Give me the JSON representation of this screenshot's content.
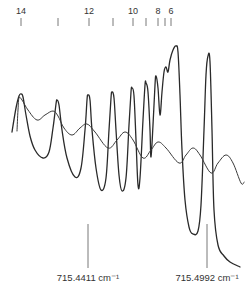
{
  "chart_data": {
    "type": "line",
    "title": "",
    "xlabel": "",
    "ylabel": "",
    "grid": false,
    "legend": null,
    "top_ticks": {
      "positions_px": [
        21,
        58,
        89,
        113,
        133,
        146,
        158,
        165,
        171
      ],
      "labels": [
        {
          "text": "14",
          "x": 21
        },
        {
          "text": "12",
          "x": 89
        },
        {
          "text": "10",
          "x": 133
        },
        {
          "text": "8",
          "x": 158
        },
        {
          "text": "6",
          "x": 171
        }
      ]
    },
    "reference_markers": [
      {
        "label": "715.4411 cm⁻¹",
        "x": 88
      },
      {
        "label": "715.4992 cm⁻¹",
        "x": 207
      }
    ],
    "series": [
      {
        "name": "sharp-resonance-trace",
        "color": "#2a2a2a",
        "points_px": [
          [
            12,
            132
          ],
          [
            16,
            108
          ],
          [
            19,
            96
          ],
          [
            21,
            94
          ],
          [
            23,
            97
          ],
          [
            26,
            115
          ],
          [
            30,
            136
          ],
          [
            35,
            150
          ],
          [
            43,
            158
          ],
          [
            49,
            152
          ],
          [
            53,
            128
          ],
          [
            56,
            104
          ],
          [
            57,
            100
          ],
          [
            59,
            105
          ],
          [
            62,
            130
          ],
          [
            67,
            158
          ],
          [
            75,
            177
          ],
          [
            81,
            168
          ],
          [
            85,
            130
          ],
          [
            87,
            100
          ],
          [
            88,
            95
          ],
          [
            90,
            100
          ],
          [
            92,
            130
          ],
          [
            96,
            168
          ],
          [
            101,
            190
          ],
          [
            106,
            178
          ],
          [
            109,
            130
          ],
          [
            111,
            98
          ],
          [
            112,
            92
          ],
          [
            114,
            98
          ],
          [
            116,
            130
          ],
          [
            119,
            175
          ],
          [
            122,
            191
          ],
          [
            126,
            178
          ],
          [
            129,
            125
          ],
          [
            131,
            92
          ],
          [
            132,
            88
          ],
          [
            134,
            96
          ],
          [
            136,
            140
          ],
          [
            138,
            185
          ],
          [
            140,
            178
          ],
          [
            143,
            120
          ],
          [
            145,
            85
          ],
          [
            146,
            83
          ],
          [
            148,
            92
          ],
          [
            150,
            130
          ],
          [
            151,
            157
          ],
          [
            153,
            125
          ],
          [
            155,
            85
          ],
          [
            156,
            76
          ],
          [
            158,
            88
          ],
          [
            160,
            115
          ],
          [
            162,
            92
          ],
          [
            164,
            72
          ],
          [
            166,
            67
          ],
          [
            168,
            72
          ],
          [
            170,
            60
          ],
          [
            173,
            50
          ],
          [
            176,
            46
          ],
          [
            178,
            52
          ],
          [
            180,
            95
          ],
          [
            182,
            150
          ],
          [
            185,
            200
          ],
          [
            189,
            227
          ],
          [
            193,
            234
          ],
          [
            198,
            231
          ],
          [
            201,
            205
          ],
          [
            204,
            130
          ],
          [
            206,
            75
          ],
          [
            208,
            56
          ],
          [
            210,
            62
          ],
          [
            212,
            130
          ],
          [
            214,
            210
          ],
          [
            218,
            245
          ],
          [
            224,
            256
          ],
          [
            230,
            262
          ],
          [
            240,
            267
          ]
        ]
      },
      {
        "name": "broad-modulation-trace",
        "color": "#3a3a3a",
        "points_px": [
          [
            17,
            131
          ],
          [
            18,
            110
          ],
          [
            19,
            98
          ],
          [
            22,
            100
          ],
          [
            28,
            110
          ],
          [
            37,
            120
          ],
          [
            45,
            115
          ],
          [
            53,
            111
          ],
          [
            58,
            116
          ],
          [
            64,
            128
          ],
          [
            72,
            135
          ],
          [
            80,
            128
          ],
          [
            87,
            124
          ],
          [
            95,
            132
          ],
          [
            108,
            148
          ],
          [
            117,
            140
          ],
          [
            125,
            132
          ],
          [
            133,
            140
          ],
          [
            143,
            158
          ],
          [
            151,
            150
          ],
          [
            158,
            142
          ],
          [
            166,
            148
          ],
          [
            179,
            163
          ],
          [
            186,
            155
          ],
          [
            193,
            148
          ],
          [
            200,
            155
          ],
          [
            211,
            173
          ],
          [
            218,
            163
          ],
          [
            226,
            155
          ],
          [
            233,
            163
          ],
          [
            241,
            183
          ],
          [
            244,
            182
          ]
        ]
      }
    ]
  }
}
